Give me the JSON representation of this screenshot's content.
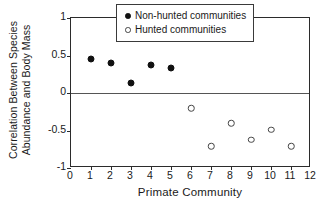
{
  "chart_data": {
    "type": "scatter",
    "title": "",
    "xlabel": "Primate Community",
    "ylabel_line1": "Correlation Between Species",
    "ylabel_line2": "Abundance and Body Mass",
    "xlim": [
      0,
      12
    ],
    "ylim": [
      -1,
      1
    ],
    "xticks": [
      0,
      1,
      2,
      3,
      4,
      5,
      6,
      7,
      8,
      9,
      10,
      11,
      12
    ],
    "xtick_labels": [
      "0",
      "1",
      "2",
      "3",
      "4",
      "5",
      "6",
      "7",
      "8",
      "9",
      "10",
      "11",
      "12"
    ],
    "yticks": [
      1,
      0.5,
      0,
      -0.5,
      -1
    ],
    "ytick_labels": [
      "1",
      "0.5",
      "0",
      "-0.5",
      "-1"
    ],
    "grid": false,
    "zero_line": true,
    "legend_position": "top-right-inside",
    "series": [
      {
        "name": "Non-hunted communities",
        "marker": "filled-circle",
        "color": "#111111",
        "x": [
          1,
          2,
          3,
          4,
          5
        ],
        "values": [
          0.45,
          0.4,
          0.14,
          0.37,
          0.33
        ]
      },
      {
        "name": "Hunted communities",
        "marker": "open-circle",
        "color": "#444444",
        "x": [
          6,
          7,
          8,
          9,
          10,
          11
        ],
        "values": [
          -0.2,
          -0.71,
          -0.4,
          -0.62,
          -0.49,
          -0.71
        ]
      }
    ]
  },
  "legend": {
    "items": [
      {
        "label": "Non-hunted communities",
        "marker": "filled-circle"
      },
      {
        "label": "Hunted communities",
        "marker": "open-circle"
      }
    ]
  }
}
